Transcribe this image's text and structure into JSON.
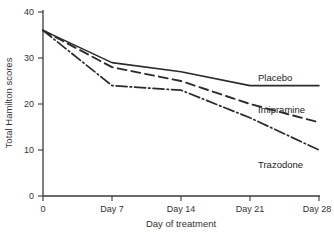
{
  "chart_data": {
    "type": "line",
    "title": "",
    "xlabel": "Day of treatment",
    "ylabel": "Total Hamilton scores",
    "x": [
      0,
      7,
      14,
      21,
      28
    ],
    "categories": [
      "0",
      "Day 7",
      "Day 14",
      "Day 21",
      "Day 28"
    ],
    "xtick_labels": [
      "0",
      "Day 7",
      "Day 14",
      "Day 21",
      "Day 28"
    ],
    "ytick_labels": [
      "0",
      "10",
      "20",
      "30",
      "40"
    ],
    "ytick_values": [
      0,
      10,
      20,
      30,
      40
    ],
    "xlim": [
      0,
      28
    ],
    "ylim": [
      0,
      40
    ],
    "grid": false,
    "legend_position": "inline-right-of-lines",
    "series": [
      {
        "name": "Placebo",
        "values": [
          36,
          29,
          27,
          24,
          24
        ],
        "style": "solid",
        "color": "#2b2b2b"
      },
      {
        "name": "Imipramine",
        "values": [
          36,
          28,
          25,
          20,
          16
        ],
        "style": "dashed",
        "color": "#2b2b2b"
      },
      {
        "name": "Trazodone",
        "values": [
          36,
          24,
          23,
          17,
          10
        ],
        "style": "dash-dot",
        "color": "#2b2b2b"
      }
    ],
    "annotations": [
      {
        "text": "Placebo",
        "x": 28,
        "y": 24
      },
      {
        "text": "Imipramine",
        "x": 28,
        "y": 16
      },
      {
        "text": "Trazodone",
        "x": 28,
        "y": 10
      }
    ]
  }
}
